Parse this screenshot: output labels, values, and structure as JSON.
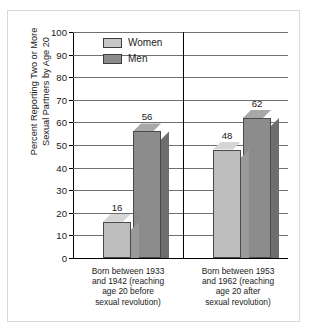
{
  "chart_data": {
    "type": "bar",
    "title": "",
    "xlabel": "",
    "ylabel": "Percent Reporting Two or More\nSexual Partners by Age 20",
    "ylim": [
      0,
      100
    ],
    "yticks": [
      100,
      90,
      80,
      70,
      60,
      50,
      40,
      30,
      20,
      10,
      0
    ],
    "grid": true,
    "legend_position": "top-left inside plot",
    "categories": [
      "Born between 1933\nand 1942 (reaching\nage 20 before\nsexual revolution)",
      "Born between 1953\nand 1962 (reaching\nage 20 after\nsexual revolution)"
    ],
    "series": [
      {
        "name": "Women",
        "values": [
          16,
          48
        ],
        "color": "#bdbdbd"
      },
      {
        "name": "Men",
        "values": [
          56,
          62
        ],
        "color": "#8c8c8c"
      }
    ],
    "data_labels": [
      "16",
      "56",
      "48",
      "62"
    ]
  },
  "legend": {
    "items": [
      {
        "label": "Women"
      },
      {
        "label": "Men"
      }
    ]
  },
  "axis": {
    "y_tick_labels": [
      "100",
      "90",
      "80",
      "70",
      "60",
      "50",
      "40",
      "30",
      "20",
      "10",
      "0"
    ]
  }
}
